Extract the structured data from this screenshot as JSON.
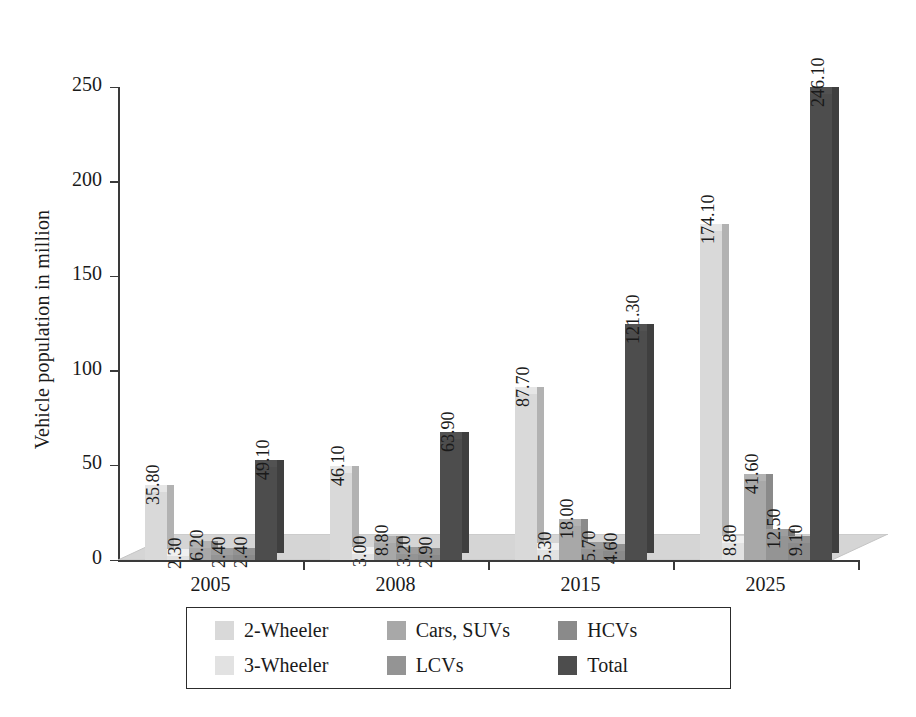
{
  "chart_data": {
    "type": "bar",
    "title": "",
    "subtitle": "",
    "xlabel": "",
    "ylabel": "Vehicle population in million",
    "ylim": [
      0,
      250
    ],
    "ytick_labels": [
      "0",
      "50",
      "100",
      "150",
      "200",
      "250"
    ],
    "yticks": [
      0,
      50,
      100,
      150,
      200,
      250
    ],
    "grid": false,
    "legend_position": "bottom",
    "style": "3d-bar",
    "categories": [
      "2005",
      "2008",
      "2015",
      "2025"
    ],
    "series": [
      {
        "name": "2-Wheeler",
        "values": [
          35.8,
          46.1,
          87.7,
          174.1
        ],
        "color": "#d9d9d9"
      },
      {
        "name": "3-Wheeler",
        "values": [
          2.3,
          3.0,
          5.3,
          8.8
        ],
        "color": "#e2e2e2"
      },
      {
        "name": "Cars, SUVs",
        "values": [
          6.2,
          8.8,
          18.0,
          41.6
        ],
        "color": "#a8a8a8"
      },
      {
        "name": "LCVs",
        "values": [
          2.4,
          3.2,
          5.7,
          12.5
        ],
        "color": "#949494"
      },
      {
        "name": "HCVs",
        "values": [
          2.4,
          2.9,
          4.6,
          9.1
        ],
        "color": "#8a8a8a"
      },
      {
        "name": "Total",
        "values": [
          49.1,
          63.9,
          121.3,
          246.1
        ],
        "color": "#4d4d4d"
      }
    ],
    "data_labels": [
      [
        "35.80",
        "2.30",
        "6.20",
        "2.40",
        "2.40",
        "49.10"
      ],
      [
        "46.10",
        "3.00",
        "8.80",
        "3.20",
        "2.90",
        "63.90"
      ],
      [
        "87.70",
        "5.30",
        "18.00",
        "5.70",
        "4.60",
        "121.30"
      ],
      [
        "174.10",
        "8.80",
        "41.60",
        "12.50",
        "9.10",
        "246.10"
      ]
    ]
  },
  "axes": {
    "y_title": "Vehicle population in million",
    "y_tick_labels": [
      "250",
      "200",
      "150",
      "100",
      "50",
      "0"
    ],
    "x_tick_labels": [
      "2005",
      "2008",
      "2015",
      "2025"
    ]
  },
  "legend": {
    "items": [
      {
        "label": "2-Wheeler",
        "color": "#d9d9d9"
      },
      {
        "label": "3-Wheeler",
        "color": "#e2e2e2"
      },
      {
        "label": "Cars, SUVs",
        "color": "#a8a8a8"
      },
      {
        "label": "LCVs",
        "color": "#949494"
      },
      {
        "label": "HCVs",
        "color": "#8a8a8a"
      },
      {
        "label": "Total",
        "color": "#4d4d4d"
      }
    ]
  },
  "colors": {
    "axis": "#3a3a3a",
    "text": "#1a1a1a",
    "floor_top": "#d5d5d5",
    "floor_front": "#c9c9c9",
    "background": "#ffffff"
  }
}
